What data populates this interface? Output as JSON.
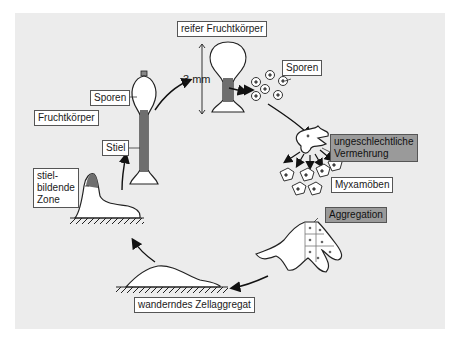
{
  "diagram": {
    "type": "life-cycle",
    "labels": {
      "reifer_fruchtkoerper": "reifer Fruchtkörper",
      "scale": "3 mm",
      "sporen_top": "Sporen",
      "ungeschlechtliche": "ungeschlechtliche",
      "vermehrung": "Vermehrung",
      "myxamoeben": "Myxamöben",
      "aggregation": "Aggregation",
      "wanderndes": "wanderndes Zellaggregat",
      "stiel_line1": "stiel-",
      "stiel_line2": "bildende",
      "stiel_line3": "Zone",
      "fruchtkoerper": "Fruchtkörper",
      "sporen_left": "Sporen",
      "stiel": "Stiel"
    },
    "stages": [
      "reifer Fruchtkörper",
      "Sporen",
      "Myxamöben (ungeschlechtliche Vermehrung)",
      "Aggregation",
      "wanderndes Zellaggregat",
      "stielbildende Zone",
      "Fruchtkörper (Sporen, Stiel)"
    ],
    "colors": {
      "background": "#ececec",
      "stalk": "#6e6e6e",
      "highlight_label": "#9a9a9a"
    }
  }
}
